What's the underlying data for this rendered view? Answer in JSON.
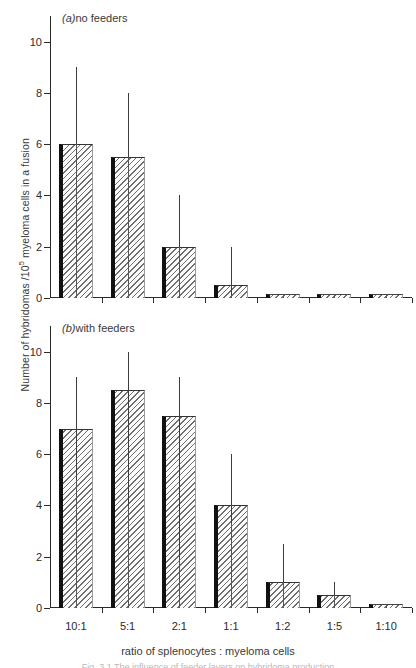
{
  "figure": {
    "ylabel_main": "Number of hybridomas /10",
    "ylabel_sup": "5",
    "ylabel_tail": " myeloma cells in a fusion",
    "xlabel": "ratio of splenocytes : myeloma cells",
    "caption": "Fig. 3.1 The influence of feeder layers on hybridoma production"
  },
  "chart_data": {
    "type": "bar",
    "title": "",
    "xlabel": "ratio of splenocytes : myeloma cells",
    "ylabel": "Number of hybridomas /10^5 myeloma cells in a fusion",
    "categories": [
      "10:1",
      "5:1",
      "2:1",
      "1:1",
      "1:2",
      "1:5",
      "1:10"
    ],
    "ylim": [
      0,
      11
    ],
    "yticks": [
      0,
      2,
      4,
      6,
      8,
      10
    ],
    "grid": false,
    "legend": "none",
    "panels": [
      {
        "id": "a",
        "prefix": "(a)",
        "label": "no feeders",
        "values": [
          6,
          5.5,
          2,
          0.5,
          0.1,
          0.1,
          0.1
        ],
        "err_high": [
          9,
          8,
          4,
          2,
          null,
          null,
          null
        ],
        "err_low": [
          6,
          5.5,
          2,
          0.1,
          null,
          null,
          null
        ]
      },
      {
        "id": "b",
        "prefix": "(b)",
        "label": "with feeders",
        "values": [
          7,
          8.5,
          7.5,
          4,
          1,
          0.5,
          0.1
        ],
        "err_high": [
          9,
          10,
          9,
          6,
          2.5,
          1,
          null
        ],
        "err_low": [
          5,
          4,
          2,
          3.3,
          1,
          0.5,
          null
        ]
      }
    ]
  }
}
